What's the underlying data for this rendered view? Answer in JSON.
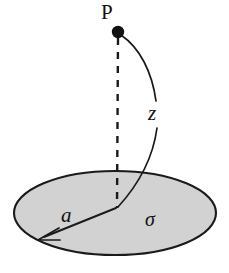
{
  "figure": {
    "background_color": "#ffffff",
    "stroke_color": "#1a1a1a",
    "disk_fill_color": "#d2d2d2"
  },
  "labels": {
    "point_p": "P",
    "height_z": "z",
    "radius_a": "a",
    "charge_density_sigma": "σ"
  },
  "geometry": {
    "disk": {
      "center_x": 115,
      "center_y": 213,
      "radius_x": 101,
      "radius_y": 42
    },
    "point_p": {
      "x": 118,
      "y": 32,
      "dot_radius": 6
    },
    "axis_foot": {
      "x": 117,
      "y": 208
    },
    "radius_arrow_tip": {
      "x": 38,
      "y": 240
    }
  },
  "elements": {
    "disk_name": "charged-disk",
    "axis_name": "vertical-axis-dashed-line",
    "point_name": "field-point-p",
    "z_curve_name": "height-indicator-curve",
    "radius_arrow_name": "radius-arrow"
  }
}
